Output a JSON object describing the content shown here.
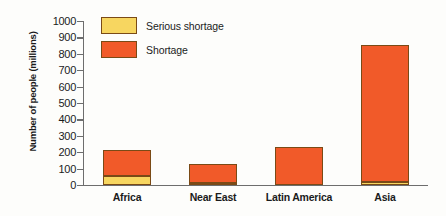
{
  "chart_data": {
    "type": "bar",
    "subtype": "stacked-bar",
    "title": "",
    "xlabel": "",
    "ylabel": "Number of people (millions)",
    "ylim": [
      0,
      1000
    ],
    "ytick_step": 100,
    "yticks": [
      1000,
      900,
      800,
      700,
      600,
      500,
      400,
      300,
      200,
      100,
      0
    ],
    "ytick_labels": [
      "1000",
      "900",
      "800",
      "700",
      "600",
      "500",
      "400",
      "300",
      "200",
      "100",
      "0"
    ],
    "categories": [
      "Africa",
      "Near East",
      "Latin America",
      "Asia"
    ],
    "grid": false,
    "legend_position": "top-left",
    "series": [
      {
        "name": "Serious shortage",
        "color": "#f7d660",
        "values": [
          55,
          5,
          0,
          20
        ]
      },
      {
        "name": "Shortage",
        "color": "#f15a29",
        "values": [
          160,
          115,
          230,
          835
        ]
      }
    ],
    "totals": [
      215,
      120,
      230,
      855
    ],
    "annotations": []
  },
  "legend": {
    "items": [
      {
        "label": "Serious shortage",
        "color": "#f7d660"
      },
      {
        "label": "Shortage",
        "color": "#f15a29"
      }
    ]
  },
  "colors": {
    "serious_shortage": "#f7d660",
    "shortage": "#f15a29",
    "bar_outline": "#7a4a16",
    "axis": "#6d6d6d",
    "text": "#1b1b1b",
    "background": "#fdfdfb"
  }
}
